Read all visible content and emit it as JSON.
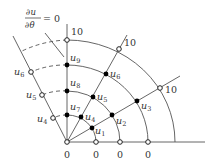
{
  "diagram": {
    "boundary_condition": {
      "numerator": "∂u",
      "denominator": "∂θ",
      "rhs": "= 0"
    },
    "boundary_values": {
      "outer": "10",
      "axis": "0"
    },
    "interior_nodes": [
      {
        "label": "u",
        "sub": "1"
      },
      {
        "label": "u",
        "sub": "2"
      },
      {
        "label": "u",
        "sub": "3"
      },
      {
        "label": "u",
        "sub": "4"
      },
      {
        "label": "u",
        "sub": "5"
      },
      {
        "label": "u",
        "sub": "6"
      },
      {
        "label": "u",
        "sub": "7"
      },
      {
        "label": "u",
        "sub": "8"
      },
      {
        "label": "u",
        "sub": "9"
      }
    ],
    "mirror_nodes": [
      {
        "label": "u",
        "sub": "4"
      },
      {
        "label": "u",
        "sub": "5"
      },
      {
        "label": "u",
        "sub": "6"
      }
    ],
    "colors": {
      "line": "#555555",
      "node_fill": "#000000",
      "text": "#333333"
    }
  }
}
